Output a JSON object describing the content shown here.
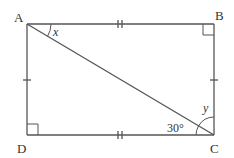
{
  "diagram": {
    "type": "rectangle with diagonal",
    "vertices": {
      "A": {
        "label": "A",
        "x": 27,
        "y": 24
      },
      "B": {
        "label": "B",
        "x": 214,
        "y": 24
      },
      "C": {
        "label": "C",
        "x": 214,
        "y": 135
      },
      "D": {
        "label": "D",
        "x": 27,
        "y": 135
      }
    },
    "diagonal": "AC",
    "angles": {
      "x": {
        "label": "x",
        "at": "A",
        "between": [
          "AB",
          "AC"
        ]
      },
      "y": {
        "label": "y",
        "at": "C",
        "between": [
          "CB",
          "CA"
        ]
      },
      "acd": {
        "label": "30°",
        "at": "C",
        "between": [
          "CA",
          "CD"
        ]
      }
    },
    "right_angles": [
      "B",
      "D"
    ],
    "tick_marks": {
      "AB": "double",
      "DC": "double",
      "AD": "single",
      "BC": "single"
    },
    "line_color": "#555555"
  }
}
